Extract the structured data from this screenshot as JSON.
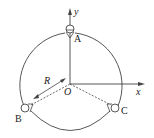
{
  "labels": {
    "y_axis": "y",
    "x_axis": "x",
    "origin": "O",
    "radius": "R",
    "point_a": "A",
    "point_b": "B",
    "point_c": "C"
  },
  "colors": {
    "stroke": "#444444",
    "text": "#222222"
  }
}
